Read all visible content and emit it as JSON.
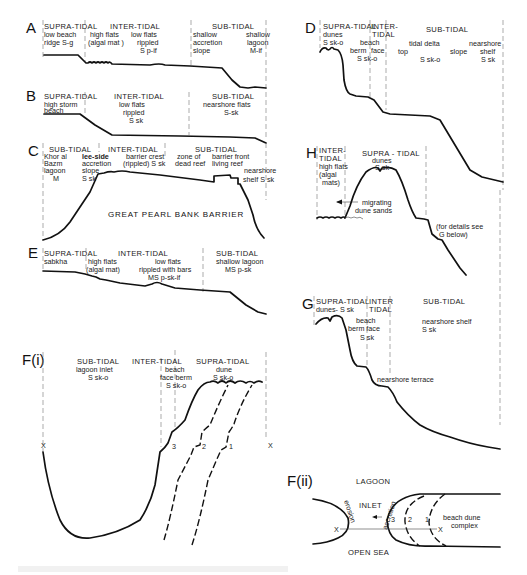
{
  "figure": {
    "panels": {
      "A": {
        "label": "A",
        "zones": {
          "supra": "SUPRA-TIDAL",
          "inter": "INTER-TIDAL",
          "sub": "SUB-TIDAL"
        },
        "notes": {
          "n1a": "low beach",
          "n1b": "ridge S-g",
          "n2a": "high flats",
          "n2b": "(algal mat )",
          "n3a": "low flats",
          "n3b": "rippled",
          "n3c": "S p-if",
          "n4a": "shallow",
          "n4b": "accretion",
          "n4c": "slope",
          "n5a": "shallow",
          "n5b": "lagoon",
          "n5c": "M-if"
        }
      },
      "B": {
        "label": "B",
        "zones": {
          "supra": "SUPRA-TIDAL",
          "inter": "INTER-TIDAL",
          "sub": "SUB-TIDAL"
        },
        "notes": {
          "n1a": "high storm",
          "n1b": "beach",
          "n2a": "low flats",
          "n2b": "rippled",
          "n2c": "S sk",
          "n3a": "nearshore flats",
          "n3b": "S-sk"
        }
      },
      "C": {
        "label": "C",
        "zones": {
          "sub1": "SUB-TIDAL",
          "inter": "INTER-TIDAL",
          "sub2": "SUB-TIDAL"
        },
        "notes": {
          "n1a": "Khor al",
          "n1b": "Bazm",
          "n1c": "lagoon",
          "n1d": "M",
          "n2a": "lee-side",
          "n2b": "accretion",
          "n2c": "slope",
          "n2d": "S sk",
          "n3a": "barrier crest",
          "n3b": "(rippled) S sk",
          "n4a": "zone of",
          "n4b": "dead reef",
          "n5a": "barrier front",
          "n5b": "living reef",
          "n6a": "nearshore",
          "n6b": "shelf S sk"
        },
        "barrier_name": "GREAT  PEARL  BANK  BARRIER"
      },
      "D": {
        "label": "D",
        "zones": {
          "supra": "SUPRA-TIDAL",
          "inter_a": "INTER-",
          "inter_b": "TIDAL",
          "sub": "SUB-TIDAL"
        },
        "notes": {
          "n1a": "dunes",
          "n1b": "S sk-o",
          "n2a": "beach",
          "n2b": "berm",
          "n2c": "face",
          "n2d": "S sk-o",
          "n3a": "tidal  delta",
          "n3b": "top",
          "n3c": "slope",
          "n3d": "S sk-o",
          "n4a": "nearshore",
          "n4b": "shelf",
          "n4c": "S sk"
        }
      },
      "E": {
        "label": "E",
        "zones": {
          "supra": "SUPRA-TIDAL",
          "inter": "INTER-TIDAL",
          "sub": "SUB-TIDAL"
        },
        "notes": {
          "n1": "sabkha",
          "n2a": "high flats",
          "n2b": "(algal mat)",
          "n3a": "low flats",
          "n3b": "rippled with bars",
          "n3c": "MS p-sk-if",
          "n4a": "shallow lagoon",
          "n4b": "MS p-sk"
        }
      },
      "H": {
        "label": "H",
        "zones": {
          "inter_a": "INTER-",
          "inter_b": "TIDAL",
          "supra": "SUPRA - TIDAL"
        },
        "notes": {
          "n1a": "high flats",
          "n1b": "(algal",
          "n1c": "mats)",
          "n2a": "dunes",
          "n2b": "S sk",
          "n3a": "migrating",
          "n3b": "dune sands",
          "n4a": "(for details see",
          "n4b": "G below)"
        }
      },
      "G": {
        "label": "G",
        "zones": {
          "supra": "SUPRA-TIDAL",
          "inter_a": "INTER",
          "inter_b": "TIDAL",
          "sub": "SUB-TIDAL"
        },
        "notes": {
          "n1": "dunes- S sk",
          "n2a": "beach",
          "n2b": "berm  face",
          "n2c": "S sk",
          "n3a": "nearshore shelf",
          "n3b": "S sk",
          "n4": "nearshore terrace"
        }
      },
      "Fi": {
        "label": "F(i)",
        "zones": {
          "sub": "SUB-TIDAL",
          "inter": "INTER-TIDAL",
          "supra": "SUPRA-TIDAL"
        },
        "notes": {
          "n1a": "lagoon  inlet",
          "n1b": "S  sk-o",
          "n2a": "beach",
          "n2b": "face berm",
          "n2c": "S sk-o",
          "n3a": "dune",
          "n3b": "S sk-o"
        },
        "markers": {
          "x_left": "X",
          "x_right": "X",
          "s3": "3",
          "s2": "2",
          "s1": "1"
        }
      },
      "Fii": {
        "label": "F(ii)",
        "notes": {
          "lagoon": "LAGOON",
          "open_sea": "OPEN SEA",
          "inlet": "INLET",
          "erosion": "erosion",
          "accretion": "accretion",
          "complex_a": "beach  dune",
          "complex_b": "complex"
        },
        "markers": {
          "x_left": "X",
          "x_right": "X",
          "s3": "3",
          "s2": "2",
          "s1": "1"
        }
      }
    }
  }
}
